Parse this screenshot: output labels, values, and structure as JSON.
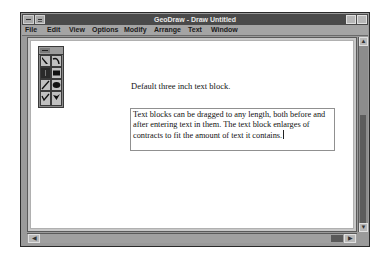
{
  "window": {
    "title": "GeoDraw - Draw Untitled"
  },
  "menubar": {
    "items": [
      {
        "label": "File",
        "x": 3
      },
      {
        "label": "Edit",
        "x": 25
      },
      {
        "label": "View",
        "x": 47
      },
      {
        "label": "Options",
        "x": 70
      },
      {
        "label": "Modify",
        "x": 102
      },
      {
        "label": "Arrange",
        "x": 132
      },
      {
        "label": "Text",
        "x": 166
      },
      {
        "label": "Window",
        "x": 189
      }
    ]
  },
  "palette": {
    "tools": [
      {
        "name": "pointer-tool",
        "icon": "arrow-pointer-icon",
        "selected": false
      },
      {
        "name": "rotate-tool",
        "icon": "curved-arrow-icon",
        "selected": false
      },
      {
        "name": "text-tool",
        "icon": "text-cursor-icon",
        "selected": true
      },
      {
        "name": "rectangle-tool",
        "icon": "filled-rectangle-icon",
        "selected": false
      },
      {
        "name": "line-tool",
        "icon": "line-icon",
        "selected": false
      },
      {
        "name": "ellipse-tool",
        "icon": "filled-ellipse-icon",
        "selected": false
      },
      {
        "name": "freehand-tool",
        "icon": "check-stroke-icon",
        "selected": false
      },
      {
        "name": "polygon-tool",
        "icon": "filled-polygon-icon",
        "selected": false
      }
    ]
  },
  "canvas": {
    "default_text": "Default three inch text block.",
    "text_block": "Text blocks can be dragged to any length, both before and after entering text in them. The text block enlarges of contracts to fit the amount of text it contains."
  },
  "scrollbars": {
    "up_arrow": "▲",
    "down_arrow": "▼",
    "left_arrow": "◀",
    "right_arrow": "▶"
  }
}
